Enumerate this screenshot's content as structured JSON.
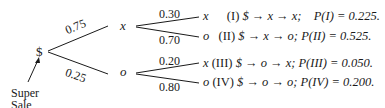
{
  "diagram": {
    "type": "probability-tree",
    "root": {
      "label": "$"
    },
    "root_annotation": {
      "line1": "Super",
      "line2": "Sale"
    },
    "level1": [
      {
        "node": "x",
        "prob": "0.75"
      },
      {
        "node": "o",
        "prob": "0.25"
      }
    ],
    "level2": [
      {
        "parent": "x",
        "prob": "0.30",
        "node": "x",
        "outcome_id": "(I)",
        "path": "$ → x → x;",
        "p_label": "P(I) = 0.225."
      },
      {
        "parent": "x",
        "prob": "0.70",
        "node": "o",
        "outcome_id": "(II)",
        "path": "$ → x → o;",
        "p_label": "P(II) = 0.525."
      },
      {
        "parent": "o",
        "prob": "0.20",
        "node": "x",
        "outcome_id": "(III)",
        "path": "$ → o → x;",
        "p_label": "P(III) = 0.050."
      },
      {
        "parent": "o",
        "prob": "0.80",
        "node": "o",
        "outcome_id": "(IV)",
        "path": "$ → o → o;",
        "p_label": "P(IV) = 0.200."
      }
    ]
  }
}
